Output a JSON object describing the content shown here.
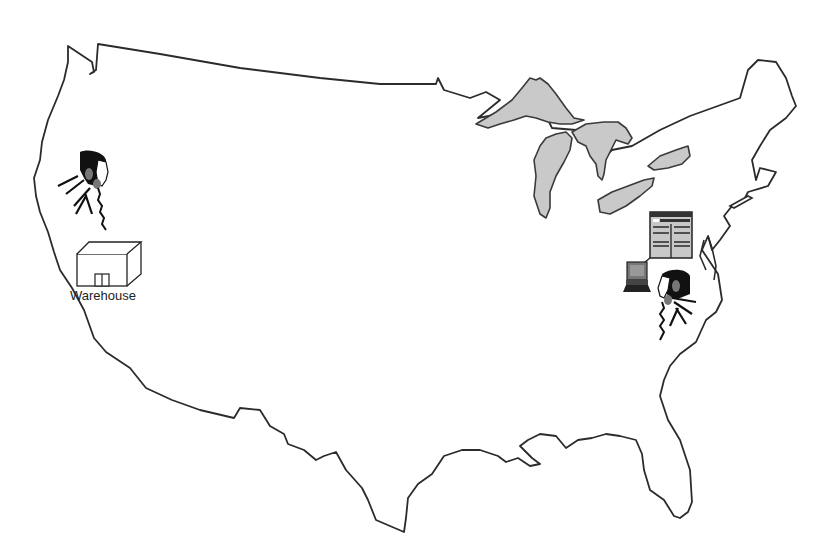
{
  "diagram": {
    "type": "map",
    "region": "Continental United States",
    "colors": {
      "background": "#ffffff",
      "outline": "#2b2b2b",
      "lakes": "#c9c9c9"
    },
    "nodes": [
      {
        "id": "west-phone-person",
        "icon": "person-on-phone-icon",
        "location": "West coast (California)"
      },
      {
        "id": "warehouse",
        "icon": "warehouse-icon",
        "label": "Warehouse",
        "location": "West coast (California)"
      },
      {
        "id": "east-phone-person",
        "icon": "person-on-phone-icon",
        "location": "East coast (Virginia)"
      },
      {
        "id": "east-computer",
        "icon": "computer-terminal-icon",
        "location": "East coast (Virginia)"
      },
      {
        "id": "east-spreadsheet",
        "icon": "spreadsheet-document-icon",
        "location": "East coast (Virginia)"
      }
    ],
    "edges": [
      {
        "from": "east-computer",
        "to": "east-spreadsheet"
      }
    ]
  },
  "labels": {
    "warehouse": "Warehouse"
  }
}
